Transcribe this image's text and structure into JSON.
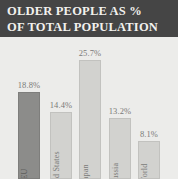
{
  "title": {
    "line1": "OLDER PEOPLE AS %",
    "line2": "OF TOTAL POPULATION"
  },
  "colors": {
    "banner_background": "#454545",
    "banner_text": "#f2f1ee",
    "plot_background": "#ececea",
    "bar_light": "#d2d2cf",
    "bar_highlight": "#8c8c8a",
    "label_text": "#7a7a78"
  },
  "chart_data": {
    "type": "bar",
    "title": "OLDER PEOPLE AS % OF TOTAL POPULATION",
    "subtitle": "",
    "xlabel": "",
    "ylabel": "",
    "ylim": [
      0,
      28
    ],
    "grid": false,
    "legend": "none",
    "unit": "%",
    "categories": [
      "EU",
      "United States",
      "Japan",
      "Russia",
      "World"
    ],
    "values": [
      18.8,
      14.4,
      25.7,
      13.2,
      8.1
    ],
    "value_labels": [
      "18.8%",
      "14.4%",
      "25.7%",
      "13.2%",
      "8.1%"
    ],
    "bars": [
      {
        "category": "EU",
        "value": 18.8,
        "label": "18.8%",
        "highlighted": true
      },
      {
        "category": "United States",
        "value": 14.4,
        "label": "14.4%",
        "highlighted": false
      },
      {
        "category": "Japan",
        "value": 25.7,
        "label": "25.7%",
        "highlighted": false
      },
      {
        "category": "Russia",
        "value": 13.2,
        "label": "13.2%",
        "highlighted": false
      },
      {
        "category": "World",
        "value": 8.1,
        "label": "8.1%",
        "highlighted": false
      }
    ]
  }
}
